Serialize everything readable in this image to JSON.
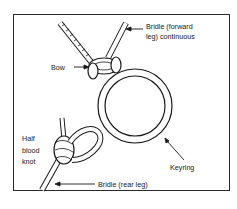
{
  "diagram": {
    "labels": {
      "bridle_forward_line1": "Bridle (forward",
      "bridle_forward_line2": "leg) continuous",
      "bow": "Bow",
      "half_line1": "Half",
      "half_line2": "blood",
      "half_line3": "knot",
      "keyring": "Keyring",
      "bridle_rear": "Bridle (rear leg)"
    },
    "colors": {
      "stroke": "#1a1a1a",
      "background": "#ffffff"
    }
  }
}
